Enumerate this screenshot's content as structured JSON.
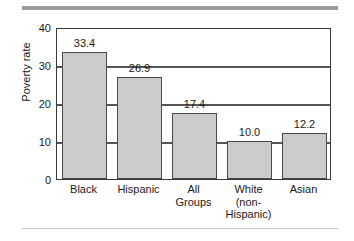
{
  "figure": {
    "top_rule_color": "#9b9b9b",
    "bottom_rule_color": "#c8c8c8",
    "background_color": "#ffffff"
  },
  "chart_data": {
    "type": "bar",
    "title": "",
    "subtitle": "",
    "xlabel": "",
    "ylabel": "Poverty rate",
    "ylim": [
      0,
      40
    ],
    "ytick_labels": [
      "40",
      "30",
      "20",
      "10",
      "0"
    ],
    "ytick_values": [
      40,
      30,
      20,
      10,
      0
    ],
    "grid": true,
    "grid_axis": "y",
    "legend": null,
    "bar_fill_color": "#cbcbcb",
    "bar_edge_color": "#4a4a4a",
    "categories": [
      "Black",
      "Hispanic",
      "All Groups",
      "White (non-Hispanic)",
      "Asian"
    ],
    "category_label_lines": [
      [
        "Black"
      ],
      [
        "Hispanic"
      ],
      [
        "All",
        "Groups"
      ],
      [
        "White",
        "(non-",
        "Hispanic)"
      ],
      [
        "Asian"
      ]
    ],
    "values": [
      33.4,
      26.9,
      17.4,
      10.0,
      12.2
    ],
    "value_labels": [
      "33.4",
      "26.9",
      "17.4",
      "10.0",
      "12.2"
    ]
  }
}
